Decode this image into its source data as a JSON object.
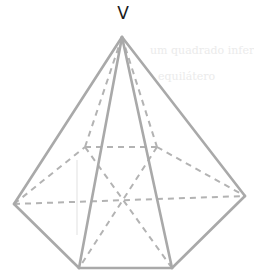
{
  "diagram": {
    "type": "hexagonal-pyramid",
    "apex_label": "V",
    "colors": {
      "solid_edge": "#a9a9a9",
      "dashed_edge": "#b3b3b3",
      "label": "#1a1a1a"
    },
    "bleed_through_text": [
      "um quadrado inferior",
      "equilátero"
    ]
  }
}
